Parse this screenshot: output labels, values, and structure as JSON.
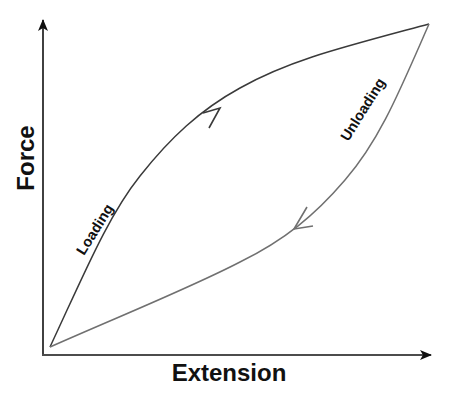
{
  "diagram": {
    "title": "",
    "type": "hysteresis-loop",
    "axes": {
      "x": {
        "label": "Extension"
      },
      "y": {
        "label": "Force"
      }
    },
    "curves": [
      {
        "name": "loading",
        "label": "Loading",
        "direction": "origin-to-peak",
        "shape": "concave-down, above diagonal",
        "color": "#3a3a3a"
      },
      {
        "name": "unloading",
        "label": "Unloading",
        "direction": "peak-to-origin",
        "shape": "concave-up, below diagonal",
        "color": "#707070"
      }
    ],
    "colors": {
      "axis": "#111111",
      "loading_curve": "#3a3a3a",
      "unloading_curve": "#707070",
      "background": "#ffffff"
    }
  }
}
